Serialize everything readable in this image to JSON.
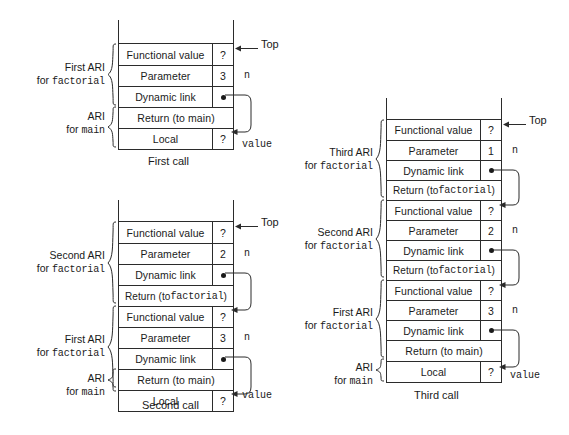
{
  "figure": {
    "row_labels": {
      "functional_value": "Functional value",
      "parameter": "Parameter",
      "dynamic_link": "Dynamic link",
      "return_to_main": "Return (to main)",
      "return_to_factorial_a": "Return (to ",
      "return_to_factorial_b": "factorial",
      "return_to_factorial_c": ")",
      "local": "Local"
    },
    "unknown_value": "?",
    "top_label": "Top",
    "n_label": "n",
    "value_label": "value"
  },
  "diagrams": [
    {
      "id": "first-call",
      "caption": "First call",
      "rows": [
        {
          "label": "Functional value",
          "value": "?",
          "wide": false
        },
        {
          "label": "Parameter",
          "value": "3",
          "wide": false,
          "side": "n"
        },
        {
          "label": "Dynamic link",
          "value": "",
          "wide": false,
          "dot": true
        },
        {
          "label": "Return (to main)",
          "value": "",
          "wide": true
        },
        {
          "label": "Local",
          "value": "?",
          "wide": false,
          "side": "value"
        }
      ],
      "groups": [
        {
          "title": "First ARI",
          "sub_prefix": "for ",
          "sub_mono": "factorial",
          "align": "right"
        },
        {
          "title": "ARI",
          "sub_prefix": "for ",
          "sub_mono": "main",
          "align": "right"
        }
      ]
    },
    {
      "id": "second-call",
      "caption": "Second call",
      "rows": [
        {
          "label": "Functional value",
          "value": "?",
          "wide": false
        },
        {
          "label": "Parameter",
          "value": "2",
          "wide": false,
          "side": "n"
        },
        {
          "label": "Dynamic link",
          "value": "",
          "wide": false,
          "dot": true
        },
        {
          "label": "Return (to factorial)",
          "value": "",
          "wide": true
        },
        {
          "label": "Functional value",
          "value": "?",
          "wide": false
        },
        {
          "label": "Parameter",
          "value": "3",
          "wide": false,
          "side": "n"
        },
        {
          "label": "Dynamic link",
          "value": "",
          "wide": false,
          "dot": true
        },
        {
          "label": "Return (to main)",
          "value": "",
          "wide": true
        },
        {
          "label": "Local",
          "value": "?",
          "wide": false,
          "side": "value"
        }
      ],
      "groups": [
        {
          "title": "Second ARI",
          "sub_prefix": "for ",
          "sub_mono": "factorial",
          "align": "right"
        },
        {
          "title": "First ARI",
          "sub_prefix": "for ",
          "sub_mono": "factorial",
          "align": "right"
        },
        {
          "title": "ARI",
          "sub_prefix": "for ",
          "sub_mono": "main",
          "align": "right"
        }
      ]
    },
    {
      "id": "third-call",
      "caption": "Third call",
      "rows": [
        {
          "label": "Functional value",
          "value": "?",
          "wide": false
        },
        {
          "label": "Parameter",
          "value": "1",
          "wide": false,
          "side": "n"
        },
        {
          "label": "Dynamic link",
          "value": "",
          "wide": false,
          "dot": true
        },
        {
          "label": "Return (to factorial)",
          "value": "",
          "wide": true
        },
        {
          "label": "Functional value",
          "value": "?",
          "wide": false
        },
        {
          "label": "Parameter",
          "value": "2",
          "wide": false,
          "side": "n"
        },
        {
          "label": "Dynamic link",
          "value": "",
          "wide": false,
          "dot": true
        },
        {
          "label": "Return (to factorial)",
          "value": "",
          "wide": true
        },
        {
          "label": "Functional value",
          "value": "?",
          "wide": false
        },
        {
          "label": "Parameter",
          "value": "3",
          "wide": false,
          "side": "n"
        },
        {
          "label": "Dynamic link",
          "value": "",
          "wide": false,
          "dot": true
        },
        {
          "label": "Return (to main)",
          "value": "",
          "wide": true
        },
        {
          "label": "Local",
          "value": "?",
          "wide": false,
          "side": "value"
        }
      ],
      "groups": [
        {
          "title": "Third ARI",
          "sub_prefix": "for ",
          "sub_mono": "factorial",
          "align": "right"
        },
        {
          "title": "Second ARI",
          "sub_prefix": "for ",
          "sub_mono": "factorial",
          "align": "right"
        },
        {
          "title": "First ARI",
          "sub_prefix": "for ",
          "sub_mono": "factorial",
          "align": "right"
        },
        {
          "title": "ARI",
          "sub_prefix": "for ",
          "sub_mono": "main",
          "align": "right"
        }
      ]
    }
  ],
  "colors": {
    "stroke": "#2b2b2b",
    "text": "#1a1a1a",
    "background": "#ffffff"
  }
}
